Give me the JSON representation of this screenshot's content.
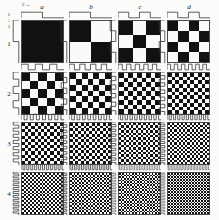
{
  "figure": {
    "background_color": "#fbfbfa",
    "ink_color": "#111111",
    "paper_color": "#fafaf8",
    "trace_color": "#3a3a3a"
  },
  "axes": {
    "column_axis_label": "a",
    "column_labels": [
      "a",
      "b",
      "c",
      "d"
    ],
    "row_labels": [
      "1",
      "2",
      "3",
      "4"
    ],
    "top_left_marker": "←",
    "left_marker": "↓",
    "top_left_tick": "2",
    "left_tick": "1"
  },
  "chart_data": {
    "type": "heatmap",
    "xlabel": "",
    "ylabel": "",
    "grid": true,
    "legend": "none",
    "columns": [
      "a",
      "b",
      "c",
      "d"
    ],
    "rows": [
      "1",
      "2",
      "3",
      "4"
    ],
    "cells": [
      {
        "row": "1",
        "col": "a",
        "nx": 1,
        "ny": 1,
        "period_x": 1,
        "period_y": 1,
        "note": "solid black"
      },
      {
        "row": "1",
        "col": "b",
        "nx": 2,
        "ny": 2,
        "period_x": 2,
        "period_y": 2,
        "note": "2x2 checker"
      },
      {
        "row": "1",
        "col": "c",
        "nx": 3,
        "ny": 3,
        "period_x": 3,
        "period_y": 3,
        "note": "3x3 checker"
      },
      {
        "row": "1",
        "col": "d",
        "nx": 4,
        "ny": 4,
        "period_x": 4,
        "period_y": 4,
        "note": "4x4 checker"
      },
      {
        "row": "2",
        "col": "a",
        "nx": 5,
        "ny": 5,
        "period_x": 5,
        "period_y": 5,
        "note": "5x5 checker"
      },
      {
        "row": "2",
        "col": "b",
        "nx": 7,
        "ny": 7,
        "period_x": 7,
        "period_y": 7,
        "note": "7x7 checker"
      },
      {
        "row": "2",
        "col": "c",
        "nx": 9,
        "ny": 9,
        "period_x": 9,
        "period_y": 9,
        "note": "9x9 checker"
      },
      {
        "row": "2",
        "col": "d",
        "nx": 11,
        "ny": 11,
        "period_x": 11,
        "period_y": 11,
        "note": "11x11 checker"
      },
      {
        "row": "3",
        "col": "a",
        "nx": 13,
        "ny": 13,
        "period_x": 13,
        "period_y": 13,
        "note": "13x13 checker"
      },
      {
        "row": "3",
        "col": "b",
        "nx": 15,
        "ny": 15,
        "period_x": 15,
        "period_y": 15,
        "note": "15x15 checker"
      },
      {
        "row": "3",
        "col": "c",
        "nx": 17,
        "ny": 17,
        "period_x": 17,
        "period_y": 17,
        "note": "17x17 checker"
      },
      {
        "row": "3",
        "col": "d",
        "nx": 19,
        "ny": 19,
        "period_x": 19,
        "period_y": 19,
        "note": "19x19 checker"
      },
      {
        "row": "4",
        "col": "a",
        "nx": 21,
        "ny": 21,
        "period_x": 21,
        "period_y": 21,
        "note": "21x21 checker"
      },
      {
        "row": "4",
        "col": "b",
        "nx": 23,
        "ny": 23,
        "period_x": 23,
        "period_y": 23,
        "note": "23x23 checker"
      },
      {
        "row": "4",
        "col": "c",
        "nx": 25,
        "ny": 25,
        "period_x": 25,
        "period_y": 25,
        "note": "25x25 checker"
      },
      {
        "row": "4",
        "col": "d",
        "nx": 27,
        "ny": 27,
        "period_x": 27,
        "period_y": 27,
        "note": "27x27 checker"
      }
    ],
    "traces": {
      "description": "Square-wave (binary) profile drawn above each tile and rotated 90 degrees to the left of each tile. Number of square-wave cycles equals the checker count of that tile.",
      "waveform": "square",
      "duty_cycle": 0.5
    }
  },
  "layout": {
    "cell_size": 43,
    "col_x": [
      21,
      69,
      118,
      167
    ],
    "row_y": [
      20,
      72,
      122,
      172
    ],
    "trace_height": 8,
    "trace_width": 8
  }
}
